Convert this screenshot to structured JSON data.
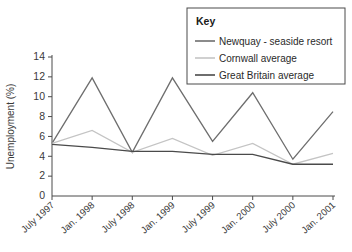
{
  "chart_data": {
    "type": "line",
    "title": "",
    "xlabel": "",
    "ylabel": "Unemployment (%)",
    "ylim": [
      0,
      14
    ],
    "yticks": [
      0,
      2,
      4,
      6,
      8,
      10,
      12,
      14
    ],
    "ytick_labels": [
      "0",
      "2",
      "4",
      "6",
      "8",
      "10",
      "12",
      "14"
    ],
    "grid": false,
    "legend_position": "top-right",
    "legend_title": "Key",
    "categories": [
      "July 1997",
      "Jan. 1998",
      "July 1998",
      "Jan. 1999",
      "July 1999",
      "Jan. 2000",
      "July 2000",
      "Jan. 2001"
    ],
    "series": [
      {
        "name": "Newquay - seaside resort",
        "color": "#6e6e6e",
        "values": [
          5.3,
          11.9,
          4.4,
          11.9,
          5.5,
          10.4,
          3.7,
          8.5
        ]
      },
      {
        "name": "Cornwall average",
        "color": "#c4c4c4",
        "values": [
          5.3,
          6.6,
          4.4,
          5.8,
          4.1,
          5.3,
          3.2,
          4.3
        ]
      },
      {
        "name": "Great Britain average",
        "color": "#4a4a4a",
        "values": [
          5.2,
          4.9,
          4.5,
          4.5,
          4.2,
          4.2,
          3.2,
          3.2
        ]
      }
    ]
  },
  "axes": {
    "y_title": "Unemployment (%)"
  }
}
